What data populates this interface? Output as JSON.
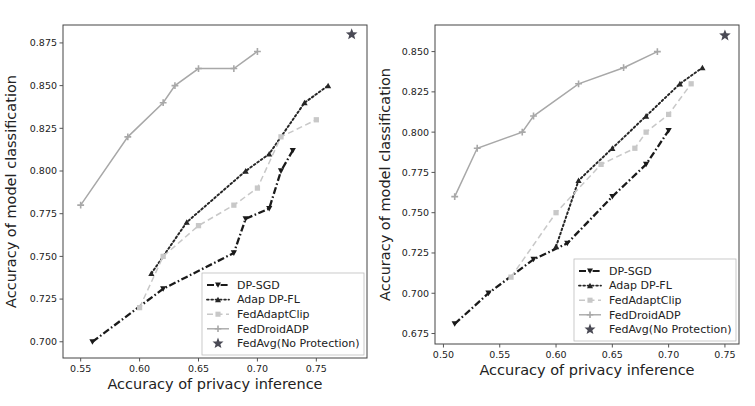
{
  "figure": {
    "background": "#ffffff",
    "panel_count": 2
  },
  "colors": {
    "dp_sgd": "#1a1a1a",
    "adap_dp_fl": "#262626",
    "fed_adapt_clip": "#c8c8c8",
    "fed_droid_adp": "#a8a8a8",
    "fed_avg": "#4a4a55",
    "axis": "#555555",
    "frame": "#444444"
  },
  "legend": {
    "items": [
      {
        "label": "DP-SGD",
        "marker": "triangle-down",
        "line": "dashdot",
        "color_key": "dp_sgd"
      },
      {
        "label": "Adap DP-FL",
        "marker": "triangle-up",
        "line": "dotted",
        "color_key": "adap_dp_fl"
      },
      {
        "label": "FedAdaptClip",
        "marker": "square",
        "line": "dashed",
        "color_key": "fed_adapt_clip"
      },
      {
        "label": "FedDroidADP",
        "marker": "plus",
        "line": "solid",
        "color_key": "fed_droid_adp"
      },
      {
        "label": "FedAvg(No Protection)",
        "marker": "star",
        "line": "none",
        "color_key": "fed_avg"
      }
    ]
  },
  "chart_data": [
    {
      "id": "left-panel",
      "type": "line",
      "title": "",
      "xlabel": "Accuracy of privacy inference",
      "ylabel": "Accuracy of model classification",
      "grid": false,
      "legend_position": "lower right",
      "xlim": [
        0.535,
        0.793
      ],
      "ylim": [
        0.6905,
        0.8855
      ],
      "xticks": [
        0.55,
        0.6,
        0.65,
        0.7,
        0.75
      ],
      "xticklabels": [
        "0.55",
        "0.60",
        "0.65",
        "0.70",
        "0.75"
      ],
      "yticks": [
        0.7,
        0.725,
        0.75,
        0.775,
        0.8,
        0.825,
        0.85,
        0.875
      ],
      "yticklabels": [
        "0.700",
        "0.725",
        "0.750",
        "0.775",
        "0.800",
        "0.825",
        "0.850",
        "0.875"
      ],
      "series": [
        {
          "name": "DP-SGD",
          "marker": "triangle-down",
          "line": "dashdot",
          "color_key": "dp_sgd",
          "x": [
            0.56,
            0.62,
            0.68,
            0.69,
            0.71,
            0.72,
            0.73
          ],
          "y": [
            0.7,
            0.731,
            0.752,
            0.772,
            0.778,
            0.8,
            0.812
          ]
        },
        {
          "name": "Adap DP-FL",
          "marker": "triangle-up",
          "line": "dotted",
          "color_key": "adap_dp_fl",
          "x": [
            0.61,
            0.64,
            0.69,
            0.71,
            0.74,
            0.76
          ],
          "y": [
            0.74,
            0.77,
            0.8,
            0.81,
            0.84,
            0.85
          ]
        },
        {
          "name": "FedAdaptClip",
          "marker": "square",
          "line": "dashed",
          "color_key": "fed_adapt_clip",
          "x": [
            0.6,
            0.62,
            0.65,
            0.68,
            0.7,
            0.72,
            0.75
          ],
          "y": [
            0.72,
            0.75,
            0.768,
            0.78,
            0.79,
            0.82,
            0.83
          ]
        },
        {
          "name": "FedDroidADP",
          "marker": "plus",
          "line": "solid",
          "color_key": "fed_droid_adp",
          "x": [
            0.55,
            0.59,
            0.62,
            0.63,
            0.65,
            0.68,
            0.7
          ],
          "y": [
            0.78,
            0.82,
            0.84,
            0.85,
            0.86,
            0.86,
            0.87
          ]
        },
        {
          "name": "FedAvg(No Protection)",
          "marker": "star",
          "line": "none",
          "color_key": "fed_avg",
          "x": [
            0.78
          ],
          "y": [
            0.88
          ]
        }
      ]
    },
    {
      "id": "right-panel",
      "type": "line",
      "title": "",
      "xlabel": "Accuracy of privacy inference",
      "ylabel": "Accuracy of model classification",
      "grid": false,
      "legend_position": "lower right",
      "xlim": [
        0.4925,
        0.7625
      ],
      "ylim": [
        0.6685,
        0.8665
      ],
      "xticks": [
        0.5,
        0.55,
        0.6,
        0.65,
        0.7,
        0.75
      ],
      "xticklabels": [
        "0.50",
        "0.55",
        "0.60",
        "0.65",
        "0.70",
        "0.75"
      ],
      "yticks": [
        0.675,
        0.7,
        0.725,
        0.75,
        0.775,
        0.8,
        0.825,
        0.85
      ],
      "yticklabels": [
        "0.675",
        "0.700",
        "0.725",
        "0.750",
        "0.775",
        "0.800",
        "0.825",
        "0.850"
      ],
      "series": [
        {
          "name": "DP-SGD",
          "marker": "triangle-down",
          "line": "dashdot",
          "color_key": "dp_sgd",
          "x": [
            0.51,
            0.54,
            0.58,
            0.61,
            0.65,
            0.68,
            0.7
          ],
          "y": [
            0.681,
            0.7,
            0.721,
            0.731,
            0.76,
            0.78,
            0.801
          ]
        },
        {
          "name": "Adap DP-FL",
          "marker": "triangle-up",
          "line": "dotted",
          "color_key": "adap_dp_fl",
          "x": [
            0.6,
            0.62,
            0.65,
            0.68,
            0.71,
            0.73
          ],
          "y": [
            0.729,
            0.77,
            0.79,
            0.81,
            0.83,
            0.84
          ]
        },
        {
          "name": "FedAdaptClip",
          "marker": "square",
          "line": "dashed",
          "color_key": "fed_adapt_clip",
          "x": [
            0.56,
            0.6,
            0.64,
            0.67,
            0.68,
            0.7,
            0.72
          ],
          "y": [
            0.71,
            0.75,
            0.78,
            0.79,
            0.8,
            0.811,
            0.83
          ]
        },
        {
          "name": "FedDroidADP",
          "marker": "plus",
          "line": "solid",
          "color_key": "fed_droid_adp",
          "x": [
            0.51,
            0.53,
            0.57,
            0.58,
            0.62,
            0.66,
            0.69
          ],
          "y": [
            0.76,
            0.79,
            0.8,
            0.81,
            0.83,
            0.84,
            0.85
          ]
        },
        {
          "name": "FedAvg(No Protection)",
          "marker": "star",
          "line": "none",
          "color_key": "fed_avg",
          "x": [
            0.75
          ],
          "y": [
            0.86
          ]
        }
      ]
    }
  ]
}
